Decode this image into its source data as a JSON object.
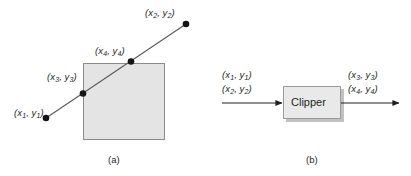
{
  "figure": {
    "panels": [
      {
        "id": "a",
        "caption": "(a)",
        "description": "Line segment crossing a rectangular clip window with two intersection points",
        "labels": {
          "p1": {
            "x_var": "x",
            "x_sub": "1",
            "y_var": "y",
            "y_sub": "1",
            "text": "(x1, y1)"
          },
          "p2": {
            "x_var": "x",
            "x_sub": "2",
            "y_var": "y",
            "y_sub": "2",
            "text": "(x2, y2)"
          },
          "p3": {
            "x_var": "x",
            "x_sub": "3",
            "y_var": "y",
            "y_sub": "3",
            "text": "(x3, y3)"
          },
          "p4": {
            "x_var": "x",
            "x_sub": "4",
            "y_var": "y",
            "y_sub": "4",
            "text": "(x4, y4)"
          }
        }
      },
      {
        "id": "b",
        "caption": "(b)",
        "description": "Block diagram: clipper transforms input endpoints into clipped endpoints",
        "block_label": "Clipper",
        "inputs": [
          {
            "x_var": "x",
            "x_sub": "1",
            "y_var": "y",
            "y_sub": "1",
            "text": "(x1, y1)"
          },
          {
            "x_var": "x",
            "x_sub": "2",
            "y_var": "y",
            "y_sub": "2",
            "text": "(x2, y2)"
          }
        ],
        "outputs": [
          {
            "x_var": "x",
            "x_sub": "3",
            "y_var": "y",
            "y_sub": "3",
            "text": "(x3, y3)"
          },
          {
            "x_var": "x",
            "x_sub": "4",
            "y_var": "y",
            "y_sub": "4",
            "text": "(x4, y4)"
          }
        ]
      }
    ],
    "colors": {
      "background": "#ffffff",
      "ink": "#231f20",
      "clip_window_fill": "#e4e4e4",
      "clip_window_stroke": "#808080",
      "block_fill": "#e8e8e8",
      "block_stroke": "#9a9a9a",
      "block_shadow": "#b8b8b8",
      "line_stroke": "#595959",
      "dot_fill": "#141414"
    },
    "geometry": {
      "clip_window": {
        "x": 83,
        "y": 63,
        "width": 82,
        "height": 77
      },
      "segment": {
        "x1": 46,
        "y1": 118,
        "x2": 186,
        "y2": 24
      },
      "points": {
        "p1": {
          "cx": 46,
          "cy": 118,
          "r": 3.3
        },
        "p2": {
          "cx": 186,
          "cy": 24,
          "r": 3.3
        },
        "p3": {
          "cx": 83,
          "cy": 93,
          "r": 3.3
        },
        "p4": {
          "cx": 131,
          "cy": 61,
          "r": 3.3
        }
      },
      "block": {
        "x": 283,
        "y": 86,
        "width": 58,
        "height": 33
      },
      "arrow_in": {
        "x1": 222,
        "y1": 103,
        "x2": 283,
        "y2": 103
      },
      "arrow_out": {
        "x1": 341,
        "y1": 103,
        "x2": 400,
        "y2": 103
      }
    }
  }
}
